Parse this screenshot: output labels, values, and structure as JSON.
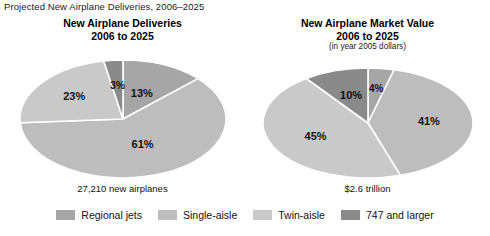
{
  "page_title": "Projected New Airplane Deliveries, 2006–2025",
  "colors": {
    "regional_jets": "#a6a6a6",
    "single_aisle": "#bdbdbd",
    "twin_aisle": "#c9c9c9",
    "larger_747": "#8a8a8a",
    "slice_border": "#ffffff",
    "text": "#111111"
  },
  "legend": {
    "items": [
      {
        "label": "Regional jets",
        "color": "#a6a6a6",
        "key": "regional_jets"
      },
      {
        "label": "Single-aisle",
        "color": "#bdbdbd",
        "key": "single_aisle"
      },
      {
        "label": "Twin-aisle",
        "color": "#c9c9c9",
        "key": "twin_aisle"
      },
      {
        "label": "747 and larger",
        "color": "#8a8a8a",
        "key": "larger_747"
      }
    ]
  },
  "panels": {
    "left": {
      "title_line1": "New Airplane Deliveries",
      "title_line2": "2006 to 2025",
      "subtitle": "",
      "caption": "27,210 new airplanes",
      "labels": {
        "s1": "13%",
        "s2": "61%",
        "s3": "23%",
        "s4": "3%"
      }
    },
    "right": {
      "title_line1": "New Airplane Market Value",
      "title_line2": "2006 to 2025",
      "subtitle": "(in year 2005 dollars)",
      "caption": "$2.6 trillion",
      "labels": {
        "s1": "4%",
        "s2": "41%",
        "s3": "45%",
        "s4": "10%"
      }
    }
  },
  "chart_data": [
    {
      "type": "pie",
      "title": "New Airplane Deliveries 2006 to 2025",
      "subtitle": "",
      "annotation": "27,210 new airplanes",
      "unit": "percent of new airplanes",
      "categories": [
        "Regional jets",
        "Single-aisle",
        "Twin-aisle",
        "747 and larger"
      ],
      "values": [
        13,
        61,
        23,
        3
      ],
      "data_labels": [
        "13%",
        "61%",
        "23%",
        "3%"
      ],
      "colors": [
        "#a6a6a6",
        "#bdbdbd",
        "#c9c9c9",
        "#8a8a8a"
      ],
      "start_angle_deg": 0,
      "direction": "clockwise",
      "legend_position": "bottom",
      "grid": false
    },
    {
      "type": "pie",
      "title": "New Airplane Market Value 2006 to 2025",
      "subtitle": "(in year 2005 dollars)",
      "annotation": "$2.6 trillion",
      "unit": "percent of market value in year 2005 dollars",
      "categories": [
        "Regional jets",
        "Single-aisle",
        "Twin-aisle",
        "747 and larger"
      ],
      "values": [
        4,
        41,
        45,
        10
      ],
      "data_labels": [
        "4%",
        "41%",
        "45%",
        "10%"
      ],
      "colors": [
        "#a6a6a6",
        "#bdbdbd",
        "#c9c9c9",
        "#8a8a8a"
      ],
      "start_angle_deg": 0,
      "direction": "clockwise",
      "legend_position": "bottom",
      "grid": false
    }
  ]
}
